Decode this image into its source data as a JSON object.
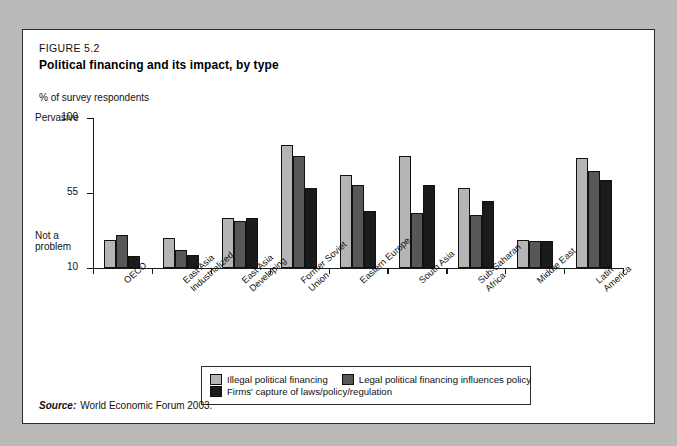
{
  "figure": {
    "number": "FIGURE 5.2",
    "title": "Political financing and its impact, by type",
    "axis_unit": "% of survey respondents",
    "source_label": "Source:",
    "source_text": "World Economic Forum 2003."
  },
  "axis": {
    "top_anchor": "Pervasive",
    "bottom_anchor": "Not a\nproblem",
    "ticks": [
      "100",
      "55",
      "10"
    ]
  },
  "colors": {
    "series1": "#b5b5b5",
    "series2": "#575757",
    "series3": "#1b1b1b",
    "axis": "#1a1a1a",
    "panel_background": "#ffffff",
    "page_background": "#b9b9b7"
  },
  "legend": [
    {
      "label": "Illegal political financing",
      "swatch": "series1"
    },
    {
      "label": "Legal political financing influences policy",
      "swatch": "series2"
    },
    {
      "label": "Firms' capture of laws/policy/regulation",
      "swatch": "series3"
    }
  ],
  "chart_data": {
    "type": "bar",
    "title": "Political financing and its impact, by type",
    "xlabel": "",
    "ylabel": "% of survey respondents",
    "ylim": [
      10,
      100
    ],
    "yticks": [
      10,
      55,
      100
    ],
    "grid": false,
    "legend_position": "bottom",
    "categories": [
      "OECD",
      "East Asia\nIndustrialized",
      "East Asia\nDeveloping",
      "Former Soviet\nUnion",
      "Eastern Europe",
      "South Asia",
      "Sub-Saharan\nAfrica",
      "Middle East",
      "Latin America"
    ],
    "series": [
      {
        "name": "Illegal political financing",
        "values": [
          27,
          28,
          40,
          84,
          66,
          77,
          58,
          27,
          76
        ]
      },
      {
        "name": "Legal political financing influences policy",
        "values": [
          30,
          21,
          38,
          77,
          60,
          43,
          42,
          26,
          68
        ]
      },
      {
        "name": "Firms' capture of laws/policy/regulation",
        "values": [
          17,
          18,
          40,
          58,
          44,
          60,
          50,
          26,
          63
        ]
      }
    ]
  }
}
